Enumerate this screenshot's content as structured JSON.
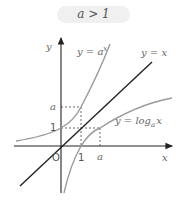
{
  "condition_label": "a > 1",
  "axes": {
    "x_label": "x",
    "y_label": "y",
    "origin_label": "O"
  },
  "ticks": {
    "x": [
      "1",
      "a"
    ],
    "y": [
      "1",
      "a"
    ]
  },
  "curves": [
    {
      "name": "exponential",
      "label": "y = a^x",
      "label_base": "y = a",
      "label_sup": "x",
      "color": "#9a9a9a"
    },
    {
      "name": "identity",
      "label": "y = x",
      "color": "#222222"
    },
    {
      "name": "logarithm",
      "label": "y = log_a x",
      "label_main": "y = log",
      "label_sub": "a",
      "label_tail": "x",
      "color": "#9a9a9a"
    }
  ]
}
